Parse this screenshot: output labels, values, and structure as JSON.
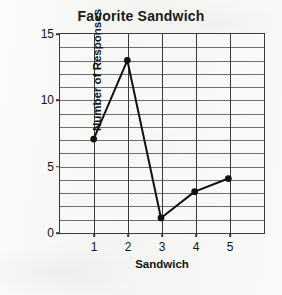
{
  "chart_data": {
    "type": "line",
    "title": "Favorite Sandwich",
    "xlabel": "Sandwich",
    "ylabel": "Number of Responses",
    "categories": [
      "1",
      "2",
      "3",
      "4",
      "5"
    ],
    "values": [
      7,
      13,
      1,
      3,
      4
    ],
    "x": [
      1,
      2,
      3,
      4,
      5
    ],
    "ylim": [
      0,
      15
    ],
    "xlim": [
      0,
      6
    ],
    "y_tick_labels": [
      "0",
      "5",
      "10",
      "15"
    ],
    "y_ticks": [
      0,
      5,
      10,
      15
    ],
    "y_gridline_step": 1,
    "x_gridline_step": 1,
    "grid": true,
    "legend": false,
    "marker": "filled-circle",
    "line_color": "#111111",
    "marker_color": "#111111",
    "grid_color": "#6e6e6e",
    "axis_color": "#3a3a3a",
    "background_color": "#f7f7f5"
  }
}
